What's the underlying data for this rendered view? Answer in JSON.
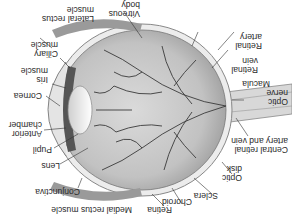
{
  "diagram": {
    "orientation": "rotated 180 degrees",
    "labels": {
      "vitreous_body": [
        "Vitreous",
        "body"
      ],
      "lateral_rectus": [
        "Lateral rectus",
        "muscle"
      ],
      "ciliary_muscle": [
        "Ciliary",
        "muscle"
      ],
      "iris_muscle": [
        "Iris",
        "muscle"
      ],
      "cornea": [
        "Cornea"
      ],
      "anterior_chamber": [
        "Anterior",
        "chamber"
      ],
      "pupil": [
        "Pupil"
      ],
      "lens": [
        "Lens"
      ],
      "conjunctiva": [
        "Conjunctiva"
      ],
      "medial_rectus": [
        "Medial rectus muscle"
      ],
      "retina": [
        "Retina"
      ],
      "choroid": [
        "Choroid"
      ],
      "sclera": [
        "Sclera"
      ],
      "optic_disk": [
        "Optic",
        "disk"
      ],
      "central_retinal": [
        "Central retinal",
        "artery and vein"
      ],
      "optic_nerve": [
        "Optic",
        "nerve"
      ],
      "macula": [
        "Macula"
      ],
      "retinal_vein": [
        "Retinal",
        "vein"
      ],
      "retinal_artery": [
        "Retinal",
        "artery"
      ]
    },
    "colors": {
      "globe": "#cfcfcf",
      "vessels": "#3a3a3a",
      "sclera": "#e6e6e6",
      "text": "#2a2a2a"
    }
  }
}
